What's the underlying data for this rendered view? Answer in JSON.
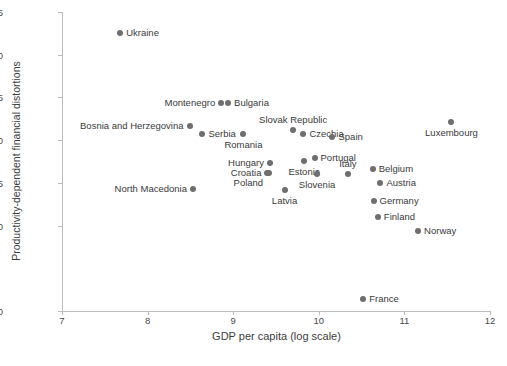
{
  "chart_data": {
    "type": "scatter",
    "title": "",
    "xlabel": "GDP per capita (log scale)",
    "ylabel": "Productivity-dependent financial distortions",
    "xlim": [
      7,
      12
    ],
    "ylim": [
      0,
      0.35
    ],
    "xticks": [
      "7",
      "8",
      "9",
      "10",
      "11",
      "12"
    ],
    "xtick_values": [
      7,
      8,
      9,
      10,
      11,
      12
    ],
    "yticks": [
      "0",
      "0.05",
      "0.10",
      "0.15",
      "0.20",
      "0.25",
      "0.30",
      "0.35"
    ],
    "ytick_values": [
      0,
      0.05,
      0.1,
      0.15,
      0.2,
      0.25,
      0.3,
      0.35
    ],
    "ytick_shown": [
      "0",
      "0.10",
      "0.15",
      "0.20",
      "0.25",
      "0.30",
      "0.35"
    ],
    "grid": false,
    "legend": false,
    "marker_color": "#6e6e6e",
    "axis_color": "#bdbdbd",
    "text_color": "#3a3a3a",
    "points": [
      {
        "label": "Ukraine",
        "x": 7.68,
        "y": 0.325,
        "label_pos": "right"
      },
      {
        "label": "Montenegro",
        "x": 8.86,
        "y": 0.243,
        "label_pos": "left"
      },
      {
        "label": "Bulgaria",
        "x": 8.94,
        "y": 0.243,
        "label_pos": "right"
      },
      {
        "label": "Bosnia and Herzegovina",
        "x": 8.49,
        "y": 0.217,
        "label_pos": "left"
      },
      {
        "label": "Serbia",
        "x": 8.64,
        "y": 0.207,
        "label_pos": "right"
      },
      {
        "label": "Romania",
        "x": 9.12,
        "y": 0.207,
        "label_pos": "below"
      },
      {
        "label": "Slovak Republic",
        "x": 9.7,
        "y": 0.212,
        "label_pos": "above"
      },
      {
        "label": "Czechia",
        "x": 9.82,
        "y": 0.207,
        "label_pos": "right"
      },
      {
        "label": "Spain",
        "x": 10.16,
        "y": 0.204,
        "label_pos": "right"
      },
      {
        "label": "Luxembourg",
        "x": 11.55,
        "y": 0.221,
        "label_pos": "below"
      },
      {
        "label": "Hungary",
        "x": 9.43,
        "y": 0.173,
        "label_pos": "left"
      },
      {
        "label": "Croatia",
        "x": 9.4,
        "y": 0.161,
        "label_pos": "left"
      },
      {
        "label": "Poland",
        "x": 9.42,
        "y": 0.161,
        "label_pos": "lower-left"
      },
      {
        "label": "Estonia",
        "x": 9.83,
        "y": 0.176,
        "label_pos": "below"
      },
      {
        "label": "Portugal",
        "x": 9.95,
        "y": 0.179,
        "label_pos": "right"
      },
      {
        "label": "Slovenia",
        "x": 9.98,
        "y": 0.16,
        "label_pos": "below"
      },
      {
        "label": "Italy",
        "x": 10.34,
        "y": 0.16,
        "label_pos": "above"
      },
      {
        "label": "Latvia",
        "x": 9.6,
        "y": 0.142,
        "label_pos": "below"
      },
      {
        "label": "North Macedonia",
        "x": 8.53,
        "y": 0.143,
        "label_pos": "left"
      },
      {
        "label": "Belgium",
        "x": 10.63,
        "y": 0.166,
        "label_pos": "right"
      },
      {
        "label": "Austria",
        "x": 10.72,
        "y": 0.15,
        "label_pos": "right"
      },
      {
        "label": "Germany",
        "x": 10.64,
        "y": 0.129,
        "label_pos": "right"
      },
      {
        "label": "Finland",
        "x": 10.69,
        "y": 0.11,
        "label_pos": "right"
      },
      {
        "label": "Norway",
        "x": 11.16,
        "y": 0.094,
        "label_pos": "right"
      },
      {
        "label": "France",
        "x": 10.52,
        "y": 0.014,
        "label_pos": "right"
      }
    ]
  },
  "footer": {
    "cut_text": ""
  }
}
